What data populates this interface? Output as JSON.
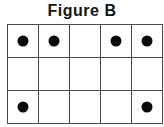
{
  "figure": {
    "title": "Figure B",
    "colors": {
      "background": "#ffffff",
      "title_text": "#141414",
      "outer_border": "#2b2b2b",
      "inner_gridline": "#4a4a4a",
      "dot_fill": "#0a0a0a"
    },
    "grid": {
      "rows": 3,
      "columns": 5,
      "cell_width_px": 30,
      "cell_height_px": 32,
      "dot_diameter_px": 11,
      "total_dots": 6,
      "row_labels": [
        "row-1",
        "row-2",
        "row-3"
      ],
      "column_labels": [
        "col-1",
        "col-2",
        "col-3",
        "col-4",
        "col-5"
      ],
      "cells": [
        [
          {
            "name": "cell-r1c1",
            "dot": true
          },
          {
            "name": "cell-r1c2",
            "dot": true
          },
          {
            "name": "cell-r1c3",
            "dot": false
          },
          {
            "name": "cell-r1c4",
            "dot": true
          },
          {
            "name": "cell-r1c5",
            "dot": true
          }
        ],
        [
          {
            "name": "cell-r2c1",
            "dot": false
          },
          {
            "name": "cell-r2c2",
            "dot": false
          },
          {
            "name": "cell-r2c3",
            "dot": false
          },
          {
            "name": "cell-r2c4",
            "dot": false
          },
          {
            "name": "cell-r2c5",
            "dot": false
          }
        ],
        [
          {
            "name": "cell-r3c1",
            "dot": true
          },
          {
            "name": "cell-r3c2",
            "dot": false
          },
          {
            "name": "cell-r3c3",
            "dot": false
          },
          {
            "name": "cell-r3c4",
            "dot": false
          },
          {
            "name": "cell-r3c5",
            "dot": true
          }
        ]
      ]
    }
  }
}
